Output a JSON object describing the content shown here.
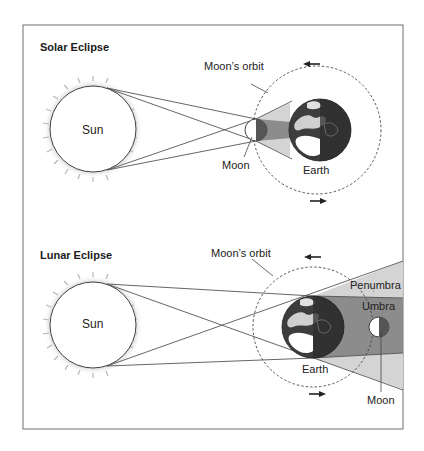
{
  "panels": {
    "solar": {
      "title": "Solar Eclipse",
      "sun_label": "Sun",
      "orbit_label": "Moon’s orbit",
      "moon_label": "Moon",
      "earth_label": "Earth",
      "arrows": [
        "orbit-arrow-left (top)",
        "orbit-arrow-right (bottom)"
      ]
    },
    "lunar": {
      "title": "Lunar Eclipse",
      "sun_label": "Sun",
      "orbit_label": "Moon’s orbit",
      "earth_label": "Earth",
      "penumbra_label": "Penumbra",
      "umbra_label": "Umbra",
      "moon_label": "Moon",
      "arrows": [
        "orbit-arrow-left (top)",
        "orbit-arrow-right (bottom)"
      ]
    }
  },
  "colors": {
    "frame": "#6e6e6e",
    "line": "#555555",
    "penumbra": "#d4d4d4",
    "umbra": "#8c8c8c",
    "earth_ocean": "#3d3d3d",
    "earth_land": "#ffffff",
    "moon_dark": "#555555"
  }
}
